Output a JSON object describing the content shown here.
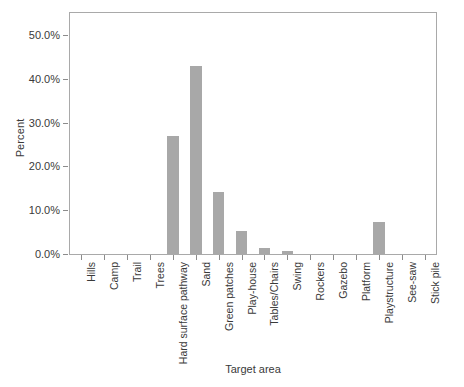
{
  "chart_data": {
    "type": "bar",
    "title": "",
    "subtitle": "",
    "xlabel": "Target area",
    "ylabel": "Percent",
    "categories": [
      "Hills",
      "Camp",
      "Trail",
      "Trees",
      "Hard surface pathway",
      "Sand",
      "Green patches",
      "Play-house",
      "Tables/Chairs",
      "Swing",
      "Rockers",
      "Gazebo",
      "Platform",
      "Playstructure",
      "See-saw",
      "Stick pile"
    ],
    "values": [
      0.0,
      0.0,
      0.0,
      0.0,
      27.0,
      43.0,
      14.2,
      5.2,
      1.4,
      0.6,
      0.0,
      0.0,
      0.0,
      7.2,
      0.0,
      0.0
    ],
    "value_labels": [
      "0.0%",
      "0.0%",
      "0.0%",
      "0.0%",
      "27.0%",
      "43.0%",
      "14.2%",
      "5.2%",
      "1.4%",
      "0.6%",
      "0.0%",
      "0.0%",
      "0.0%",
      "7.2%",
      "0.0%",
      "0.0%"
    ],
    "ylim": [
      0,
      55
    ],
    "yticks": [
      0,
      10,
      20,
      30,
      40,
      50
    ],
    "ytick_labels": [
      "0.0%",
      "10.0%",
      "20.0%",
      "30.0%",
      "40.0%",
      "50.0%"
    ],
    "grid": false,
    "legend": null,
    "legend_position": "none",
    "bar_color": "#a8a8a8",
    "axis_color": "#a9a9a9",
    "text_color": "#3a3a3a",
    "bar_width_fraction": 0.5
  }
}
